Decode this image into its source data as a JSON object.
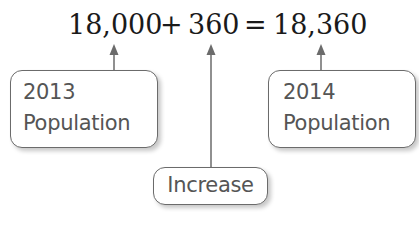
{
  "equation": {
    "term1": "18,000",
    "plus": "+",
    "term2": "360",
    "equals": "=",
    "result": "18,360"
  },
  "labels": {
    "population_2013": {
      "line1": "2013",
      "line2": "Population"
    },
    "increase": "Increase",
    "population_2014": {
      "line1": "2014",
      "line2": "Population"
    }
  },
  "colors": {
    "equation_text": "#1a1a1a",
    "label_text": "#555555",
    "arrow": "#6b6b6b",
    "box_border": "#6b6b6b"
  }
}
